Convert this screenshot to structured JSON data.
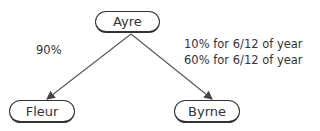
{
  "diagram": {
    "nodes": {
      "root": {
        "label": "Ayre"
      },
      "left": {
        "label": "Fleur"
      },
      "right": {
        "label": "Byrne"
      }
    },
    "edges": {
      "left": {
        "label": "90%"
      },
      "right": {
        "line1": "10% for 6/12 of year",
        "line2": "60% for 6/12 of year"
      }
    }
  }
}
